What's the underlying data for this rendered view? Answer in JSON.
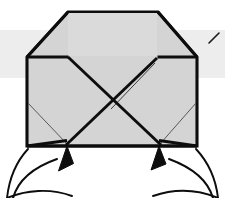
{
  "figure": {
    "title": "Origami folding step diagram",
    "type": "line-drawing",
    "caption": "",
    "canvas": {
      "width": 225,
      "height": 198
    },
    "colors": {
      "background": "#ffffff",
      "paper_fill": "#d4d4d4",
      "paper_fill_light": "#dcdcdc",
      "ink": "#0d0d0d",
      "crease_line": "#3a3a3a",
      "scan_band": "#ededed"
    },
    "line_weights": {
      "outline": 3.1,
      "major_fold": 2.8,
      "minor_crease": 0.9,
      "arrow_tail": 1.9
    }
  },
  "shapes": {
    "paper_body": {
      "name": "folded-paper-outline",
      "description": "Pentagonal folded paper body with flat top, beveled upper corners and square lower body",
      "points": "68,12 158,12 197,57 197,146 27,146 27,57"
    },
    "top_inner_panel": {
      "name": "top-center-panel",
      "description": "Central trapezoid panel along the top edge",
      "points": "68,12 158,12 158,57 68,57"
    },
    "corner_bevel_left": {
      "name": "left-bevel-fold",
      "points": "27,57 68,12 68,57"
    },
    "corner_bevel_right": {
      "name": "right-bevel-fold",
      "points": "197,57 158,12 158,57"
    }
  },
  "fold_lines": [
    {
      "name": "top-left-horizontal-crease",
      "path": "M 27,57 L 68,57",
      "weight": "major_fold"
    },
    {
      "name": "top-right-horizontal-crease",
      "path": "M 158,57 L 197,57",
      "weight": "major_fold"
    },
    {
      "name": "left-bevel-diagonal",
      "path": "M 27,57 L 68,12",
      "weight": "major_fold"
    },
    {
      "name": "right-bevel-diagonal",
      "path": "M 197,57 L 158,12",
      "weight": "major_fold"
    },
    {
      "name": "diagonal-upper-left-to-center",
      "path": "M 68,57 L 113,103",
      "weight": "major_fold"
    },
    {
      "name": "diagonal-center-to-lower-right",
      "path": "M 113,103 L 160,145",
      "weight": "major_fold"
    },
    {
      "name": "diagonal-upper-right-to-center",
      "path": "M 158,58 L 110,106",
      "weight": "major_fold"
    },
    {
      "name": "diagonal-center-to-lower-left",
      "path": "M 110,106 L 67,145",
      "weight": "major_fold"
    },
    {
      "name": "parallel-crease-upper-right",
      "path": "M 156,62 L 112,108",
      "weight": "minor_crease"
    },
    {
      "name": "thin-crease-left-corner",
      "path": "M 28,103 L 67,144",
      "weight": "minor_crease"
    },
    {
      "name": "thin-crease-right-corner",
      "path": "M 196,103 L 160,144",
      "weight": "minor_crease"
    },
    {
      "name": "bottom-left-flap-edge",
      "path": "M 27,146 L 67,141",
      "weight": "major_fold"
    },
    {
      "name": "bottom-right-flap-edge",
      "path": "M 197,146 L 160,141",
      "weight": "major_fold"
    }
  ],
  "annotations": {
    "arrows": [
      {
        "name": "left-fold-arrow",
        "points_to": "bottom-left-inner-corner",
        "tip": {
          "x": 66,
          "y": 147
        },
        "tail_path": "M 14,196 C 18,176 36,166 56,160",
        "head_points": "66,147 60,170 73,165"
      },
      {
        "name": "right-fold-arrow",
        "points_to": "bottom-right-inner-corner",
        "tip": {
          "x": 158,
          "y": 147
        },
        "tail_path": "M 212,196 C 206,176 186,166 168,160",
        "head_points": "158,147 152,168 166,165"
      }
    ],
    "guide_curves": [
      {
        "name": "left-outer-guide-curve",
        "path": "M 27,149 C 14,163 9,180 8,197"
      },
      {
        "name": "right-outer-guide-curve",
        "path": "M 197,149 C 210,163 216,180 218,197"
      },
      {
        "name": "left-lower-join-curve",
        "path": "M 8,197 C 30,193 52,192 76,197"
      },
      {
        "name": "right-lower-join-curve",
        "path": "M 218,197 C 198,193 176,192 152,197"
      }
    ],
    "stray_marks": [
      {
        "name": "top-right-cropped-tick",
        "path": "M 208,42 L 218,33",
        "weight": "minor_crease"
      }
    ],
    "scan_band": {
      "name": "scan-artifact-band",
      "x": 0,
      "y": 30,
      "width": 225,
      "height": 48
    }
  },
  "labels": {
    "figure_label": "",
    "step_number": ""
  }
}
